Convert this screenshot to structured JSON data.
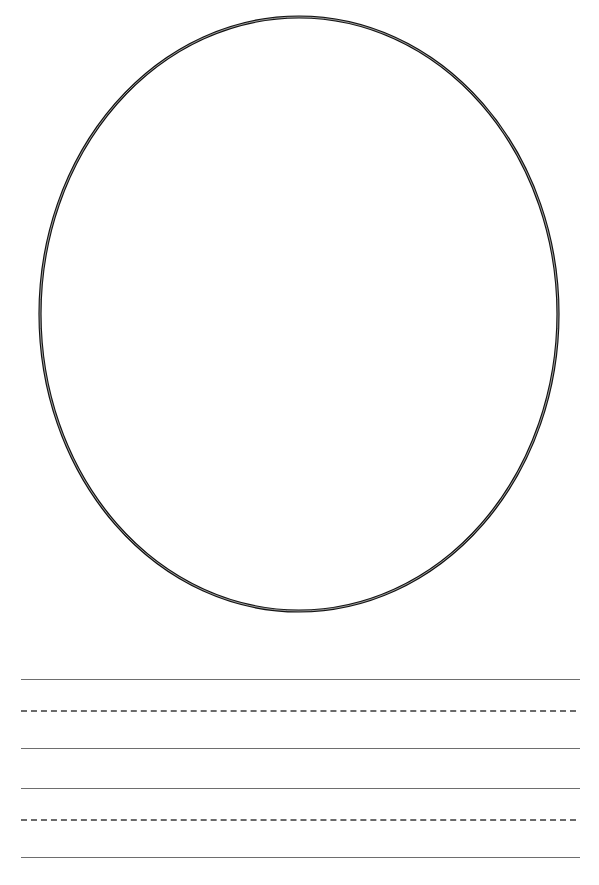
{
  "page": {
    "top_text_clipped": "",
    "drawing_frame": {
      "shape": "oval",
      "center": [
        299,
        314
      ],
      "radius_x": 259,
      "radius_y": 297,
      "stroke_color": "#111111"
    },
    "writing_lines": {
      "color": "#6e6e6e",
      "groups": [
        {
          "top_solid_y": 680,
          "dashed_y": 711,
          "bottom_solid_y": 749
        },
        {
          "top_solid_y": 789,
          "dashed_y": 820,
          "bottom_solid_y": 858
        }
      ]
    }
  }
}
